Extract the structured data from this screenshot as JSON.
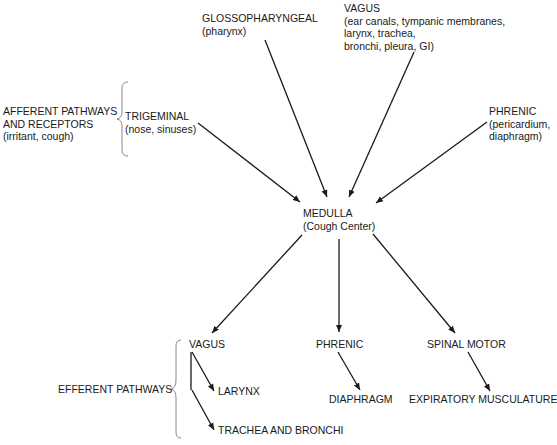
{
  "afferent": {
    "group_label_line1": "AFFERENT PATHWAYS",
    "group_label_line2": "AND RECEPTORS",
    "group_label_line3": "(irritant, cough)",
    "trigeminal": {
      "name": "TRIGEMINAL",
      "detail": "(nose, sinuses)"
    },
    "glossopharyngeal": {
      "name": "GLOSSOPHARYNGEAL",
      "detail": "(pharynx)"
    },
    "vagus": {
      "name": "VAGUS",
      "detail_line1": "(ear canals, tympanic membranes,",
      "detail_line2": "larynx, trachea,",
      "detail_line3": "bronchi, pleura, GI)"
    },
    "phrenic": {
      "name": "PHRENIC",
      "detail_line1": "(pericardium,",
      "detail_line2": "diaphragm)"
    }
  },
  "center": {
    "name": "MEDULLA",
    "detail": "(Cough Center)"
  },
  "efferent": {
    "group_label": "EFFERENT PATHWAYS",
    "vagus": {
      "name": "VAGUS",
      "targets": [
        "LARYNX",
        "TRACHEA AND BRONCHI"
      ]
    },
    "phrenic": {
      "name": "PHRENIC",
      "target": "DIAPHRAGM"
    },
    "spinal_motor": {
      "name": "SPINAL MOTOR",
      "target": "EXPIRATORY MUSCULATURE"
    }
  },
  "colors": {
    "line": "#1a1a1a",
    "brace": "#888888"
  }
}
